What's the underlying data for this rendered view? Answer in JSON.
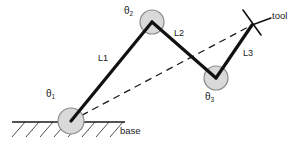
{
  "diagram": {
    "background_color": "#ffffff",
    "stroke_color": "#1a1a1a",
    "joint_fill_color": "#d9d9d9",
    "joint_stroke_color": "#8c8c8c",
    "labels": {
      "theta1": "θ",
      "theta1_sub": "1",
      "theta2": "θ",
      "theta2_sub": "2",
      "theta3": "θ",
      "theta3_sub": "3",
      "link1": "L1",
      "link2": "L2",
      "link3": "L3",
      "base": "base",
      "tool": "tool"
    },
    "joints": [
      {
        "name": "base-joint",
        "label": "θ1",
        "cx": 71,
        "cy": 121,
        "r": 13
      },
      {
        "name": "elbow-joint",
        "label": "θ2",
        "cx": 152,
        "cy": 22,
        "r": 12
      },
      {
        "name": "wrist-joint",
        "label": "θ3",
        "cx": 216,
        "cy": 78,
        "r": 12
      }
    ],
    "links": [
      {
        "name": "link-1",
        "label": "L1",
        "from": [
          71,
          121
        ],
        "to": [
          152,
          22
        ]
      },
      {
        "name": "link-2",
        "label": "L2",
        "from": [
          152,
          22
        ],
        "to": [
          216,
          78
        ]
      },
      {
        "name": "link-3",
        "label": "L3",
        "from": [
          216,
          78
        ],
        "to": [
          252,
          25
        ]
      }
    ],
    "tool_point": [
      252,
      25
    ],
    "reach_line": {
      "name": "reach-dashed-line",
      "from": [
        71,
        121
      ],
      "to": [
        252,
        25
      ],
      "style": "dashed"
    },
    "ground": {
      "name": "ground-line",
      "x1": 12,
      "x2": 125,
      "y": 122,
      "hatch_count": 8
    }
  }
}
